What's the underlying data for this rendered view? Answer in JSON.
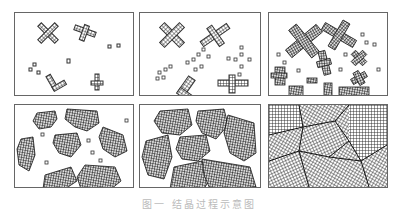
{
  "figure": {
    "caption": "图一 结晶过程示意图",
    "panels": [
      {
        "id": "a",
        "stage": "nucleation",
        "row": 1,
        "col": 1
      },
      {
        "id": "b",
        "stage": "early growth",
        "row": 1,
        "col": 2
      },
      {
        "id": "c",
        "stage": "dendritic growth",
        "row": 1,
        "col": 3
      },
      {
        "id": "d",
        "stage": "grain growth",
        "row": 2,
        "col": 1
      },
      {
        "id": "e",
        "stage": "impingement",
        "row": 2,
        "col": 2
      },
      {
        "id": "f",
        "stage": "complete polycrystal",
        "row": 2,
        "col": 3
      }
    ]
  }
}
